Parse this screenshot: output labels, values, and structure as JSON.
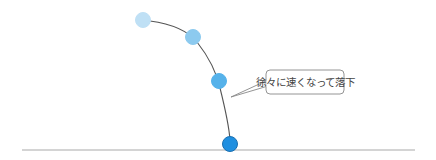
{
  "diagram": {
    "title": "",
    "callout": {
      "text": "徐々に速くなって落下"
    },
    "balls": [
      {
        "label": "ball-1",
        "cx": 143,
        "cy": 20,
        "r": 7.5,
        "color": "#bfe0f5",
        "stroke": "#bfe0f5"
      },
      {
        "label": "ball-2",
        "cx": 193,
        "cy": 37,
        "r": 7.5,
        "color": "#8ccaef",
        "stroke": "#8ccaef"
      },
      {
        "label": "ball-3",
        "cx": 219,
        "cy": 81,
        "r": 7.5,
        "color": "#56b2ea",
        "stroke": "#56b2ea"
      },
      {
        "label": "ball-4",
        "cx": 230,
        "cy": 144,
        "r": 7.5,
        "color": "#1f8fe0",
        "stroke": "#1a6fb0"
      }
    ],
    "colors": {
      "trajectory": "#555555",
      "ground": "#aaaaaa",
      "callout_border": "#888888",
      "callout_fill": "#ffffff"
    }
  }
}
